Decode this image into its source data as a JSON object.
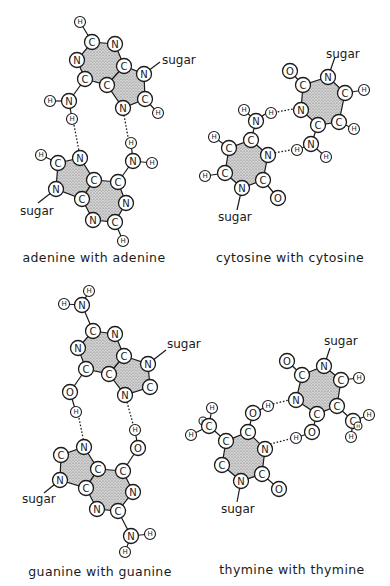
{
  "figure": {
    "panels": [
      {
        "id": "adenine",
        "caption": "adenine with adenine",
        "sugar_label": "sugar"
      },
      {
        "id": "cytosine",
        "caption": "cytosine with cytosine",
        "sugar_label": "sugar"
      },
      {
        "id": "guanine",
        "caption": "guanine with guanine",
        "sugar_label": "sugar"
      },
      {
        "id": "thymine",
        "caption": "thymine with thymine",
        "sugar_label": "sugar"
      }
    ],
    "atom_symbols": {
      "carbon": "C",
      "nitrogen": "N",
      "oxygen": "O",
      "hydrogen": "H"
    },
    "colors": {
      "ink": "#1a1a1a",
      "ring_fill": "#bdbdbd",
      "background": "#ffffff"
    }
  }
}
